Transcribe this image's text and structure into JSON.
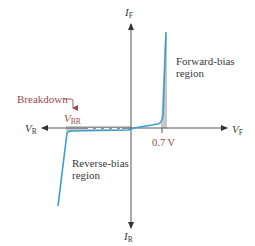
{
  "diagram": {
    "axes": {
      "y_positive": {
        "symbol": "I",
        "subscript": "F"
      },
      "y_negative": {
        "symbol": "I",
        "subscript": "R"
      },
      "x_positive": {
        "symbol": "V",
        "subscript": "F"
      },
      "x_negative": {
        "symbol": "V",
        "subscript": "R"
      }
    },
    "annotations": {
      "breakdown": "Breakdown",
      "breakdown_voltage": {
        "symbol": "V",
        "subscript": "BR"
      },
      "knee_voltage": "0.7 V",
      "forward_region_line1": "Forward-bias",
      "forward_region_line2": "region",
      "reverse_region_line1": "Reverse-bias",
      "reverse_region_line2": "region"
    },
    "colors": {
      "curve": "#3a9fd0",
      "axis": "#444444",
      "breakdown_label": "#9a4a4a",
      "shading": "#bdbdbd"
    }
  }
}
